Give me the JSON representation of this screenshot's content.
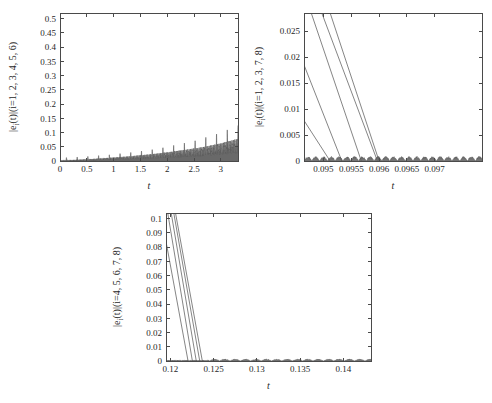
{
  "figure": {
    "background_color": "#ffffff",
    "trace_color": "#5c5c5c",
    "axis_color": "#4a4a4a",
    "text_color": "#1f1f1f"
  },
  "chart_data": [
    {
      "id": "panel-1",
      "type": "line",
      "title": "",
      "xlabel": "t",
      "ylabel": "|e_i(t)|(i=1, 2, 3, 4, 5, 6)",
      "ylabel_display": "|e  (t)|(i=1, 2, 3, 4, 5, 6)",
      "ylabel_parts": {
        "prefix": "|e",
        "subscript": "i",
        "suffix": "(t)|(i=1, 2, 3, 4, 5, 6)"
      },
      "xlim": [
        0,
        3.32
      ],
      "ylim": [
        0,
        0.52
      ],
      "xticks": [
        0,
        0.5,
        1,
        1.5,
        2,
        2.5,
        3
      ],
      "xticklabels": [
        "0",
        "0.5",
        "1",
        "1.5",
        "2",
        "2.5",
        "3"
      ],
      "yticks": [
        0,
        0.05,
        0.1,
        0.15,
        0.2,
        0.25,
        0.3,
        0.35,
        0.4,
        0.45,
        0.5
      ],
      "yticklabels": [
        "0",
        "0.05",
        "0.1",
        "0.15",
        "0.2",
        "0.25",
        "0.3",
        "0.35",
        "0.4",
        "0.45",
        "0.5"
      ],
      "grid": false,
      "legend": "none",
      "description": "Dense oscillatory error envelope near zero with periodic sharp spikes of slowly growing amplitude.",
      "spikes": {
        "first_spike_t": 0.12,
        "spike_period": 0.2,
        "count": 17,
        "peak_heights": [
          0.012,
          0.014,
          0.016,
          0.019,
          0.022,
          0.026,
          0.03,
          0.035,
          0.04,
          0.047,
          0.055,
          0.063,
          0.072,
          0.083,
          0.095,
          0.11,
          0.125,
          0.148
        ],
        "max_peak": 0.15
      },
      "envelope": {
        "t": [
          0,
          0.3,
          0.6,
          0.9,
          1.2,
          1.5,
          1.8,
          2.1,
          2.4,
          2.7,
          3.0,
          3.32
        ],
        "upper": [
          0.002,
          0.004,
          0.007,
          0.011,
          0.015,
          0.02,
          0.026,
          0.033,
          0.041,
          0.05,
          0.062,
          0.078
        ]
      }
    },
    {
      "id": "panel-2",
      "type": "line",
      "title": "",
      "xlabel": "t",
      "ylabel": "|e_i(t)|(i=1, 2, 3, 7, 8)",
      "ylabel_parts": {
        "prefix": "|e",
        "subscript": "i",
        "suffix": "(t)|(i=1, 2, 3, 7, 8)"
      },
      "xlim": [
        0.09465,
        0.09785
      ],
      "ylim": [
        0,
        0.0285
      ],
      "xticks": [
        0.095,
        0.0955,
        0.096,
        0.0965,
        0.097
      ],
      "xticklabels": [
        "0.095",
        "0.0955",
        "0.096",
        "0.0965",
        "0.097"
      ],
      "yticks": [
        0,
        0.005,
        0.01,
        0.015,
        0.02,
        0.025
      ],
      "yticklabels": [
        "0",
        "0.005",
        "0.01",
        "0.015",
        "0.02",
        "0.025"
      ],
      "grid": false,
      "legend": "none",
      "description": "Five straight descending traces falling from the top-left to zero at staggered times, then flat near-zero residual ripple.",
      "series": [
        {
          "name": "e_1",
          "x_start": 0.09465,
          "y_start": 0.0078,
          "x_zero": 0.09512
        },
        {
          "name": "e_2",
          "x_start": 0.09465,
          "y_start": 0.0185,
          "x_zero": 0.09533
        },
        {
          "name": "e_3",
          "x_start": 0.09478,
          "y_start": 0.0285,
          "x_zero": 0.09568
        },
        {
          "name": "e_7",
          "x_start": 0.09497,
          "y_start": 0.0285,
          "x_zero": 0.09597
        },
        {
          "name": "e_8",
          "x_start": 0.09512,
          "y_start": 0.0285,
          "x_zero": 0.096
        }
      ],
      "residual": {
        "mean": 0.0003,
        "max": 0.0009
      }
    },
    {
      "id": "panel-3",
      "type": "line",
      "title": "",
      "xlabel": "t",
      "ylabel": "|e_i(t)|(i=4, 5, 6, 7, 8)",
      "ylabel_parts": {
        "prefix": "|e",
        "subscript": "i",
        "suffix": "(t)|(i=4, 5, 6, 7, 8)"
      },
      "xlim": [
        0.1195,
        0.1432
      ],
      "ylim": [
        0,
        0.104
      ],
      "xticks": [
        0.12,
        0.125,
        0.13,
        0.135,
        0.14
      ],
      "xticklabels": [
        "0.12",
        "0.125",
        "0.13",
        "0.135",
        "0.14"
      ],
      "yticks": [
        0,
        0.01,
        0.02,
        0.03,
        0.04,
        0.05,
        0.06,
        0.07,
        0.08,
        0.09,
        0.1
      ],
      "yticklabels": [
        "0",
        "0.01",
        "0.02",
        "0.03",
        "0.04",
        "0.05",
        "0.06",
        "0.07",
        "0.08",
        "0.09",
        "0.1"
      ],
      "grid": false,
      "legend": "none",
      "description": "Five steep nearly parallel descending traces dropping from the top edge to zero around t=0.122-0.1235, followed by a low-amplitude periodic ripple along the zero axis.",
      "series": [
        {
          "name": "e_4",
          "x_start": 0.1195,
          "y_start": 0.084,
          "x_zero": 0.12205
        },
        {
          "name": "e_5",
          "x_start": 0.1197,
          "y_start": 0.104,
          "x_zero": 0.12255
        },
        {
          "name": "e_6",
          "x_start": 0.1201,
          "y_start": 0.104,
          "x_zero": 0.123
        },
        {
          "name": "e_7",
          "x_start": 0.1204,
          "y_start": 0.104,
          "x_zero": 0.1234
        },
        {
          "name": "e_8",
          "x_start": 0.1206,
          "y_start": 0.104,
          "x_zero": 0.1237
        }
      ],
      "ripple": {
        "period": 0.0012,
        "amplitude": 0.0014,
        "start_t": 0.1245
      }
    }
  ]
}
